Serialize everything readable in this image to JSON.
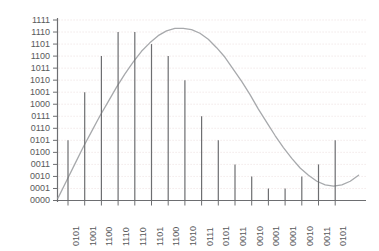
{
  "chart_data": {
    "type": "bar",
    "title": "",
    "subtitle": "",
    "xlabel": "",
    "ylabel": "",
    "grid": true,
    "legend": null,
    "ylim": [
      0,
      15
    ],
    "ytick_labels": [
      "1111",
      "1110",
      "1101",
      "1100",
      "1011",
      "1010",
      "1001",
      "1000",
      "0111",
      "0110",
      "0101",
      "0100",
      "0011",
      "0010",
      "0001",
      "0000"
    ],
    "ytick_values": [
      15,
      14,
      13,
      12,
      11,
      10,
      9,
      8,
      7,
      6,
      5,
      4,
      3,
      2,
      1,
      0
    ],
    "categories": [
      "0101",
      "1001",
      "1100",
      "1110",
      "1110",
      "1101",
      "1100",
      "1010",
      "0111",
      "0101",
      "0011",
      "0010",
      "0001",
      "0001",
      "0010",
      "0011",
      "0101"
    ],
    "values": [
      5,
      9,
      12,
      14,
      14,
      13,
      12,
      10,
      7,
      5,
      3,
      2,
      1,
      1,
      2,
      3,
      5
    ],
    "series": [
      {
        "name": "quantized samples",
        "values": [
          5,
          9,
          12,
          14,
          14,
          13,
          12,
          10,
          7,
          5,
          3,
          2,
          1,
          1,
          2,
          3,
          5
        ]
      }
    ],
    "curve": {
      "name": "analog sine wave",
      "x": [
        0,
        0.5,
        1,
        1.5,
        2,
        2.5,
        3,
        3.5,
        4,
        4.5,
        5,
        5.5,
        6,
        6.5,
        7,
        7.5,
        8,
        8.5,
        9,
        9.5,
        10,
        10.5,
        11,
        11.5,
        12,
        12.5,
        13,
        13.5,
        14,
        14.5,
        15,
        15.5,
        16,
        16.5,
        17,
        17.5,
        18
      ],
      "y": [
        0.2,
        1.6,
        3.0,
        4.4,
        5.7,
        7.0,
        8.2,
        9.4,
        10.5,
        11.5,
        12.4,
        13.1,
        13.7,
        14.1,
        14.3,
        14.3,
        14.2,
        13.9,
        13.4,
        12.7,
        11.9,
        10.9,
        9.9,
        8.8,
        7.6,
        6.5,
        5.4,
        4.4,
        3.5,
        2.7,
        2.1,
        1.6,
        1.3,
        1.2,
        1.3,
        1.6,
        2.1
      ]
    }
  },
  "style": {
    "axis_color": "#6d6e71",
    "grid_color": "#e8d8d8",
    "bar_color": "#6d6e71",
    "curve_color": "#a7a9ac",
    "label_color": "#58595b",
    "background": "#ffffff"
  }
}
